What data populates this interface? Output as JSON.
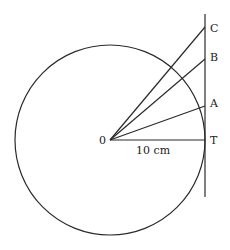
{
  "diagram": {
    "type": "geometry-circle-tangent",
    "center": {
      "label": "0",
      "x": 110,
      "y": 140
    },
    "circle": {
      "radius_px": 95
    },
    "radius_label": "10 cm",
    "tangent_line": {
      "x": 205,
      "y_top": 14,
      "y_bottom": 197
    },
    "points": {
      "C": {
        "label": "C",
        "x": 205,
        "y": 27
      },
      "B": {
        "label": "B",
        "x": 205,
        "y": 59
      },
      "A": {
        "label": "A",
        "x": 205,
        "y": 106
      },
      "T": {
        "label": "T",
        "x": 205,
        "y": 140
      }
    }
  }
}
